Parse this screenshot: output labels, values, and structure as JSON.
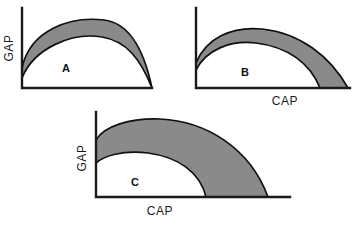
{
  "figure": {
    "background_color": "#ffffff",
    "stroke_color": "#101010",
    "band_fill_color": "#8a8a8a",
    "axis_color": "#1a1a1a"
  },
  "chart_data": {
    "type": "line",
    "title": "",
    "xlabel": "CAP",
    "ylabel": "GAP",
    "grid": false,
    "legend": null,
    "panels": [
      {
        "id": "A",
        "letter": "A",
        "ylabel": "GAP",
        "xlabel": "",
        "show_xlabel": false,
        "show_ylabel": true,
        "description": "Thin crescent band between two concave-down arcs that meet at the right end of the horizontal axis.",
        "band_thickness": "thin",
        "axes": {
          "origin_x": 22,
          "origin_y": 88,
          "y_top": 8,
          "x_right": 152
        },
        "outer_curve": "M22,68 C30,30 70,16 104,20 C130,23 144,50 152,88",
        "inner_curve": "M22,78 C34,48 72,32 102,37 C126,41 140,58 152,88"
      },
      {
        "id": "B",
        "letter": "B",
        "ylabel": "",
        "xlabel": "CAP",
        "show_xlabel": true,
        "show_ylabel": false,
        "description": "Medium-width crescent band; inner arc lands on the axis well before the outer arc.",
        "band_thickness": "medium",
        "axes": {
          "origin_x": 196,
          "origin_y": 88,
          "y_top": 8,
          "x_right": 350
        },
        "outer_curve": "M196,63 C206,38 232,26 262,29 C300,33 330,56 348,88",
        "inner_curve": "M196,70 C206,50 230,40 256,43 C288,47 310,63 320,88"
      },
      {
        "id": "C",
        "letter": "C",
        "ylabel": "GAP",
        "xlabel": "CAP",
        "show_xlabel": true,
        "show_ylabel": true,
        "description": "Thick crescent band; inner arc lands on the axis far before the outer arc.",
        "band_thickness": "thick",
        "axes": {
          "origin_x": 96,
          "origin_y": 197,
          "y_top": 112,
          "x_right": 290
        },
        "outer_curve": "M96,140 C104,126 130,118 160,119 C206,121 250,148 268,197",
        "inner_curve": "M96,163 C104,156 122,150 148,153 C178,157 200,172 206,197"
      }
    ]
  },
  "labels": {
    "gap": "GAP",
    "cap": "CAP",
    "panel_a": "A",
    "panel_b": "B",
    "panel_c": "C"
  }
}
